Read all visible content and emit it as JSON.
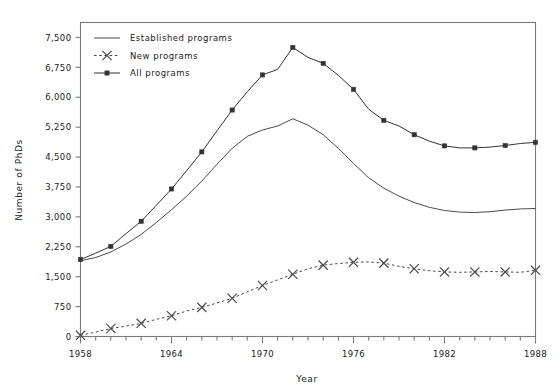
{
  "chart_data": {
    "type": "line",
    "title": "",
    "xlabel": "Year",
    "ylabel": "Number of PhDs",
    "xlim": [
      1958,
      1988
    ],
    "ylim": [
      0,
      7875
    ],
    "grid": false,
    "legend_position": "top-left",
    "x_tick_labels": [
      "1958",
      "1964",
      "1970",
      "1976",
      "1982",
      "1988"
    ],
    "x_major_ticks": [
      1958,
      1964,
      1970,
      1976,
      1982,
      1988
    ],
    "x_minor_tick_step": 1,
    "y_tick_labels": [
      "0",
      "750",
      "1,500",
      "2,250",
      "3,000",
      "3,750",
      "4,500",
      "5,250",
      "6,000",
      "6,750",
      "7,500"
    ],
    "y_ticks": [
      0,
      750,
      1500,
      2250,
      3000,
      3750,
      4500,
      5250,
      6000,
      6750,
      7500
    ],
    "x": [
      1958,
      1959,
      1960,
      1961,
      1962,
      1963,
      1964,
      1965,
      1966,
      1967,
      1968,
      1969,
      1970,
      1971,
      1972,
      1973,
      1974,
      1975,
      1976,
      1977,
      1978,
      1979,
      1980,
      1981,
      1982,
      1983,
      1984,
      1985,
      1986,
      1987,
      1988
    ],
    "series": [
      {
        "name": "Established programs",
        "style": "solid",
        "marker": "none",
        "color": "#4a4a4a",
        "values": [
          1900,
          1980,
          2120,
          2320,
          2560,
          2860,
          3180,
          3520,
          3900,
          4320,
          4720,
          5020,
          5180,
          5280,
          5460,
          5300,
          5060,
          4720,
          4340,
          3980,
          3720,
          3520,
          3360,
          3240,
          3160,
          3120,
          3110,
          3130,
          3170,
          3200,
          3210
        ]
      },
      {
        "name": "New programs",
        "style": "dashed",
        "marker": "x",
        "color": "#4a4a4a",
        "values": [
          30,
          110,
          200,
          260,
          330,
          430,
          520,
          640,
          730,
          840,
          960,
          1120,
          1280,
          1420,
          1560,
          1700,
          1790,
          1830,
          1860,
          1870,
          1840,
          1760,
          1700,
          1650,
          1620,
          1610,
          1620,
          1630,
          1620,
          1610,
          1660
        ]
      },
      {
        "name": "All programs",
        "style": "solid",
        "marker": "square",
        "color": "#333333",
        "values": [
          1930,
          2090,
          2260,
          2580,
          2890,
          3290,
          3700,
          4160,
          4630,
          5160,
          5680,
          6140,
          6560,
          6700,
          7250,
          7000,
          6850,
          6550,
          6200,
          5700,
          5420,
          5280,
          5060,
          4900,
          4780,
          4730,
          4730,
          4750,
          4790,
          4840,
          4870
        ]
      }
    ],
    "marker_interval_years": 2
  },
  "legend": {
    "items": [
      {
        "label": "Established programs",
        "key": "established"
      },
      {
        "label": "New programs",
        "key": "new"
      },
      {
        "label": "All programs",
        "key": "all"
      }
    ]
  },
  "axes": {
    "x_title": "Year",
    "y_title": "Number of PhDs"
  },
  "colors": {
    "line": "#4a4a4a",
    "marker": "#333333",
    "frame": "#7a7a7a",
    "text": "#1a1a1a",
    "background": "#ffffff"
  }
}
